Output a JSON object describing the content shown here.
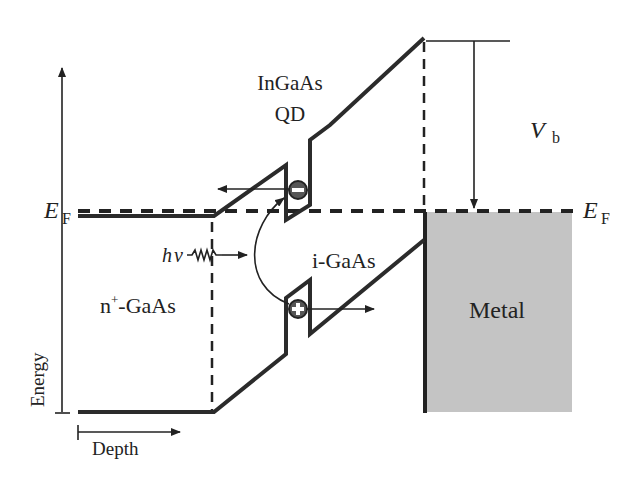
{
  "diagram": {
    "type": "band-diagram",
    "labels": {
      "qd_line1": "InGaAs",
      "qd_line2": "QD",
      "vb_main": "V",
      "vb_sub": "b",
      "ef_left_main": "E",
      "ef_left_sub": "F",
      "ef_right_main": "E",
      "ef_right_sub": "F",
      "photon_h": "h",
      "photon_nu": "ν",
      "n_region_pre": "n",
      "n_region_sup": "+",
      "n_region_post": "-GaAs",
      "i_region": "i-GaAs",
      "metal": "Metal",
      "energy_axis": "Energy",
      "depth_axis": "Depth",
      "electron_symbol": "−",
      "hole_symbol": "+"
    },
    "colors": {
      "band_line": "#2b2b2b",
      "metal_fill": "#c4c4c4",
      "text": "#222222"
    }
  }
}
